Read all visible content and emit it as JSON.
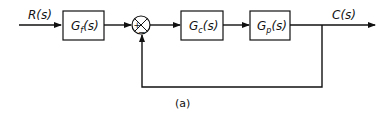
{
  "diagram": {
    "type": "block-diagram",
    "caption": "(a)",
    "input": {
      "label": "R(s)"
    },
    "output": {
      "label": "C(s)"
    },
    "blocks": [
      {
        "id": "Gf",
        "main": "G",
        "sub": "f",
        "arg": "(s)"
      },
      {
        "id": "Gc",
        "main": "G",
        "sub": "c",
        "arg": "(s)"
      },
      {
        "id": "Gp",
        "main": "G",
        "sub": "p",
        "arg": "(s)"
      }
    ],
    "summing_junction": {
      "plus_sign": "+",
      "minus_sign": "−"
    },
    "connections": [
      {
        "from": "R(s)",
        "to": "Gf"
      },
      {
        "from": "Gf",
        "to": "summing_junction",
        "sign": "+"
      },
      {
        "from": "summing_junction",
        "to": "Gc"
      },
      {
        "from": "Gc",
        "to": "Gp"
      },
      {
        "from": "Gp",
        "to": "C(s)"
      },
      {
        "from": "C(s)",
        "to": "summing_junction",
        "sign": "−",
        "type": "feedback"
      }
    ]
  }
}
